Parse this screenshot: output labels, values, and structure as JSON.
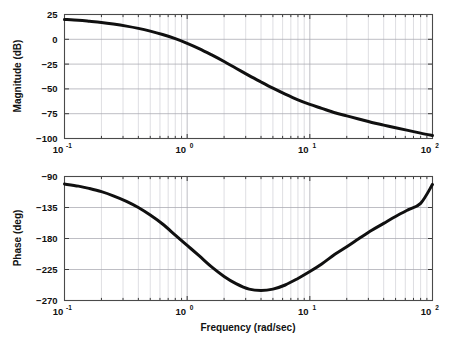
{
  "figure": {
    "background_color": "#ffffff",
    "curve_color": "#101010",
    "grid_major_color": "#a8a8b0",
    "grid_minor_color": "#c2c2ca",
    "frame_color": "#4a4a4a"
  },
  "xaxis": {
    "label": "Frequency (rad/sec)",
    "scale": "log",
    "min": 0.1,
    "max": 100,
    "tick_mantissas": [
      "10",
      "10",
      "10",
      "10"
    ],
    "tick_exponents": [
      "-1",
      "0",
      "1",
      "2"
    ],
    "tick_values": [
      0.1,
      1,
      10,
      100
    ]
  },
  "magnitude_axis": {
    "label": "Magnitude (dB)",
    "min": -100,
    "max": 25,
    "ticks": [
      "25",
      "0",
      "−25",
      "−50",
      "−75",
      "−100"
    ],
    "tick_values": [
      25,
      0,
      -25,
      -50,
      -75,
      -100
    ]
  },
  "phase_axis": {
    "label": "Phase (deg)",
    "min": -270,
    "max": -90,
    "ticks": [
      "−90",
      "−135",
      "−180",
      "−225",
      "−270"
    ],
    "tick_values": [
      -90,
      -135,
      -180,
      -225,
      -270
    ]
  },
  "chart_data": [
    {
      "type": "line",
      "title": "Bode Magnitude Plot",
      "xlabel": "Frequency (rad/sec)",
      "ylabel": "Magnitude (dB)",
      "xscale": "log",
      "xlim": [
        0.1,
        100
      ],
      "ylim": [
        -100,
        25
      ],
      "grid": true,
      "legend": null,
      "series": [
        {
          "name": "magnitude",
          "x": [
            0.1,
            0.13,
            0.16,
            0.2,
            0.25,
            0.32,
            0.4,
            0.5,
            0.63,
            0.8,
            1.0,
            1.25,
            1.6,
            2.0,
            2.5,
            3.2,
            4.0,
            5.0,
            6.3,
            8.0,
            10.0,
            12.5,
            16.0,
            20.0,
            25.0,
            32.0,
            40.0,
            50.0,
            63.0,
            80.0,
            100.0
          ],
          "y": [
            20.0,
            19.2,
            18.2,
            17.0,
            15.4,
            13.3,
            11.0,
            8.2,
            4.8,
            0.7,
            -4.0,
            -9.3,
            -16.0,
            -22.4,
            -29.2,
            -36.6,
            -43.0,
            -49.2,
            -55.2,
            -61.0,
            -65.6,
            -69.6,
            -74.0,
            -77.2,
            -80.3,
            -83.8,
            -86.5,
            -89.2,
            -91.8,
            -94.6,
            -97.0
          ]
        }
      ]
    },
    {
      "type": "line",
      "title": "Bode Phase Plot",
      "xlabel": "Frequency (rad/sec)",
      "ylabel": "Phase (deg)",
      "xscale": "log",
      "xlim": [
        0.1,
        100
      ],
      "ylim": [
        -270,
        -90
      ],
      "grid": true,
      "legend": null,
      "series": [
        {
          "name": "phase",
          "x": [
            0.1,
            0.13,
            0.16,
            0.2,
            0.25,
            0.32,
            0.4,
            0.5,
            0.63,
            0.8,
            1.0,
            1.25,
            1.6,
            2.0,
            2.5,
            3.2,
            4.0,
            5.0,
            6.3,
            8.0,
            10.0,
            12.5,
            16.0,
            20.0,
            25.0,
            32.0,
            40.0,
            50.0,
            63.0,
            80.0,
            100.0
          ],
          "y": [
            -101.0,
            -104.0,
            -107.5,
            -112.0,
            -118.0,
            -126.0,
            -135.0,
            -146.0,
            -159.0,
            -175.0,
            -190.0,
            -205.0,
            -222.0,
            -235.0,
            -245.5,
            -253.5,
            -255.5,
            -253.5,
            -247.5,
            -238.0,
            -228.0,
            -217.0,
            -203.0,
            -192.0,
            -180.5,
            -168.0,
            -158.0,
            -148.0,
            -138.5,
            -129.0,
            -101.5
          ]
        }
      ]
    }
  ]
}
